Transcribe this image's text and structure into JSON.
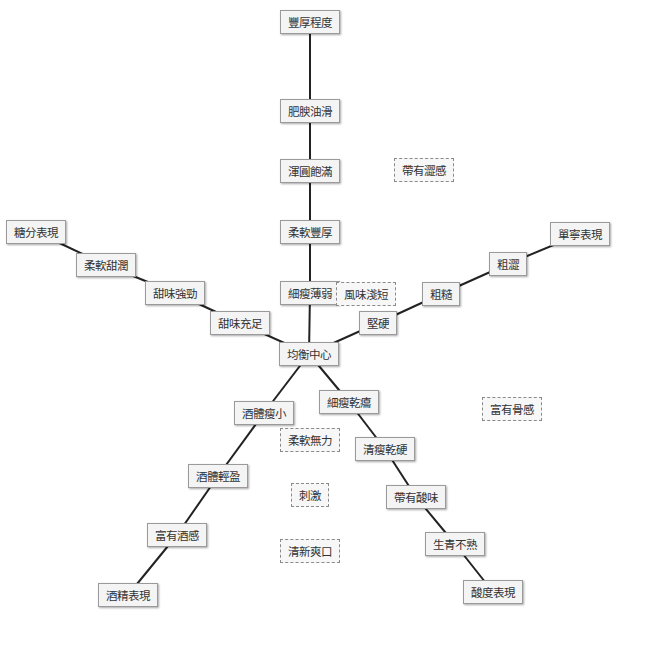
{
  "diagram": {
    "type": "radial-axis-diagram",
    "edge_color": "#222222",
    "nodes": [
      {
        "id": "body_extent",
        "label": "豐厚程度",
        "x": 310,
        "y": 22,
        "style": "solid"
      },
      {
        "id": "fat_smooth",
        "label": "肥腴油滑",
        "x": 310,
        "y": 111,
        "style": "solid"
      },
      {
        "id": "round_full",
        "label": "渾圓飽滿",
        "x": 310,
        "y": 171,
        "style": "solid"
      },
      {
        "id": "soft_rich",
        "label": "柔軟豐厚",
        "x": 310,
        "y": 232,
        "style": "solid"
      },
      {
        "id": "thin_weak",
        "label": "細瘦薄弱",
        "x": 310,
        "y": 293,
        "style": "solid"
      },
      {
        "id": "center",
        "label": "均衡中心",
        "x": 309,
        "y": 354,
        "style": "solid"
      },
      {
        "id": "astringent",
        "label": "帶有澀感",
        "x": 424,
        "y": 170,
        "style": "dashed"
      },
      {
        "id": "short_finish",
        "label": "風味淺短",
        "x": 366,
        "y": 294,
        "style": "dashed"
      },
      {
        "id": "sugar",
        "label": "糖分表現",
        "x": 36,
        "y": 232,
        "style": "solid"
      },
      {
        "id": "soft_sweet",
        "label": "柔軟甜潤",
        "x": 106,
        "y": 265,
        "style": "solid"
      },
      {
        "id": "strong_sweet",
        "label": "甜味強勁",
        "x": 175,
        "y": 293,
        "style": "solid"
      },
      {
        "id": "ample_sweet",
        "label": "甜味充足",
        "x": 240,
        "y": 323,
        "style": "solid"
      },
      {
        "id": "hard",
        "label": "堅硬",
        "x": 378,
        "y": 323,
        "style": "solid"
      },
      {
        "id": "coarse",
        "label": "粗糙",
        "x": 441,
        "y": 294,
        "style": "solid"
      },
      {
        "id": "rough_astr",
        "label": "粗澀",
        "x": 508,
        "y": 264,
        "style": "solid"
      },
      {
        "id": "tannin",
        "label": "單寧表現",
        "x": 580,
        "y": 234,
        "style": "solid"
      },
      {
        "id": "thin_dry",
        "label": "細瘦乾癟",
        "x": 349,
        "y": 402,
        "style": "solid"
      },
      {
        "id": "lean_hard",
        "label": "清瘦乾硬",
        "x": 385,
        "y": 449,
        "style": "solid"
      },
      {
        "id": "sour",
        "label": "帶有酸味",
        "x": 416,
        "y": 497,
        "style": "solid"
      },
      {
        "id": "unripe",
        "label": "生青不熟",
        "x": 455,
        "y": 544,
        "style": "solid"
      },
      {
        "id": "acidity",
        "label": "酸度表現",
        "x": 493,
        "y": 592,
        "style": "solid"
      },
      {
        "id": "thin_body",
        "label": "酒體瘦小",
        "x": 264,
        "y": 413,
        "style": "solid"
      },
      {
        "id": "light_body",
        "label": "酒體輕盈",
        "x": 218,
        "y": 476,
        "style": "solid"
      },
      {
        "id": "alcoholic",
        "label": "富有酒感",
        "x": 177,
        "y": 535,
        "style": "solid"
      },
      {
        "id": "alcohol",
        "label": "酒精表現",
        "x": 128,
        "y": 595,
        "style": "solid"
      },
      {
        "id": "soft_weak",
        "label": "柔軟無力",
        "x": 310,
        "y": 440,
        "style": "dashed"
      },
      {
        "id": "irritating",
        "label": "刺激",
        "x": 310,
        "y": 495,
        "style": "dashed"
      },
      {
        "id": "fresh",
        "label": "清新爽口",
        "x": 310,
        "y": 551,
        "style": "dashed"
      },
      {
        "id": "bony",
        "label": "富有骨感",
        "x": 512,
        "y": 409,
        "style": "dashed"
      }
    ],
    "edges": [
      [
        "body_extent",
        "fat_smooth"
      ],
      [
        "fat_smooth",
        "round_full"
      ],
      [
        "round_full",
        "soft_rich"
      ],
      [
        "soft_rich",
        "thin_weak"
      ],
      [
        "thin_weak",
        "center"
      ],
      [
        "sugar",
        "soft_sweet"
      ],
      [
        "soft_sweet",
        "strong_sweet"
      ],
      [
        "strong_sweet",
        "ample_sweet"
      ],
      [
        "ample_sweet",
        "center"
      ],
      [
        "tannin",
        "rough_astr"
      ],
      [
        "rough_astr",
        "coarse"
      ],
      [
        "coarse",
        "hard"
      ],
      [
        "hard",
        "center"
      ],
      [
        "center",
        "thin_dry"
      ],
      [
        "thin_dry",
        "lean_hard"
      ],
      [
        "lean_hard",
        "sour"
      ],
      [
        "sour",
        "unripe"
      ],
      [
        "unripe",
        "acidity"
      ],
      [
        "center",
        "thin_body"
      ],
      [
        "thin_body",
        "light_body"
      ],
      [
        "light_body",
        "alcoholic"
      ],
      [
        "alcoholic",
        "alcohol"
      ]
    ]
  }
}
